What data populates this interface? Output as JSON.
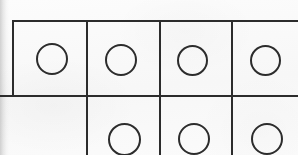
{
  "sheet": {
    "title": "Scanned worksheet grid",
    "width": 298,
    "height": 155,
    "paper_color": "#fafafa",
    "ink_color": "#2c2c2c",
    "edge_shadow_color": "#969696",
    "description": "Partial photocopied table of square cells, each containing a hand-drawn open circle; the grid is cropped on the right and bottom edges."
  },
  "grid": {
    "rows": 2,
    "columns": 4,
    "origin_x": 12,
    "origin_y": 21,
    "row_divider_y": 96,
    "column_divider_x": [
      87,
      160,
      232
    ],
    "line_width": 2,
    "cropped_right": true,
    "cropped_bottom": true
  },
  "lines": {
    "horizontal": [
      {
        "name": "grid-top-border",
        "x": 12,
        "y": 20,
        "length": 286
      },
      {
        "name": "grid-row-divider",
        "x": 0,
        "y": 95,
        "length": 298
      }
    ],
    "vertical": [
      {
        "name": "grid-left-border",
        "x": 12,
        "y": 20,
        "length": 77
      },
      {
        "name": "column-divider-1",
        "x": 86,
        "y": 20,
        "length": 135
      },
      {
        "name": "column-divider-2",
        "x": 159,
        "y": 20,
        "length": 135
      },
      {
        "name": "column-divider-3",
        "x": 231,
        "y": 20,
        "length": 135
      }
    ]
  },
  "cells": [
    {
      "name": "cell-r1c1",
      "row": 1,
      "column": 1,
      "x": 14,
      "y": 22,
      "width": 72,
      "height": 73,
      "has_circle": true,
      "circle": {
        "cx": 38,
        "cy": 37,
        "diameter": 32
      },
      "cropped": false
    },
    {
      "name": "cell-r1c2",
      "row": 1,
      "column": 2,
      "x": 88,
      "y": 22,
      "width": 71,
      "height": 73,
      "has_circle": true,
      "circle": {
        "cx": 33,
        "cy": 38,
        "diameter": 32
      },
      "cropped": false
    },
    {
      "name": "cell-r1c3",
      "row": 1,
      "column": 3,
      "x": 161,
      "y": 22,
      "width": 70,
      "height": 73,
      "has_circle": true,
      "circle": {
        "cx": 31,
        "cy": 38,
        "diameter": 31
      },
      "cropped": false
    },
    {
      "name": "cell-r1c4",
      "row": 1,
      "column": 4,
      "x": 233,
      "y": 22,
      "width": 65,
      "height": 73,
      "has_circle": true,
      "circle": {
        "cx": 32,
        "cy": 38,
        "diameter": 31
      },
      "cropped": true
    },
    {
      "name": "cell-r2c1",
      "row": 2,
      "column": 1,
      "x": 0,
      "y": 97,
      "width": 86,
      "height": 58,
      "has_circle": false,
      "circle": null,
      "cropped": true
    },
    {
      "name": "cell-r2c2",
      "row": 2,
      "column": 2,
      "x": 88,
      "y": 97,
      "width": 71,
      "height": 58,
      "has_circle": true,
      "circle": {
        "cx": 36,
        "cy": 42,
        "diameter": 33
      },
      "cropped": true
    },
    {
      "name": "cell-r2c3",
      "row": 2,
      "column": 3,
      "x": 161,
      "y": 97,
      "width": 70,
      "height": 58,
      "has_circle": true,
      "circle": {
        "cx": 33,
        "cy": 42,
        "diameter": 32
      },
      "cropped": true
    },
    {
      "name": "cell-r2c4",
      "row": 2,
      "column": 4,
      "x": 233,
      "y": 97,
      "width": 65,
      "height": 58,
      "has_circle": true,
      "circle": {
        "cx": 34,
        "cy": 42,
        "diameter": 32
      },
      "cropped": true
    }
  ]
}
